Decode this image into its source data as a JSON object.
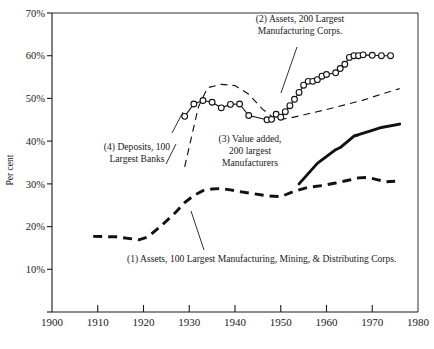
{
  "chart_data": {
    "type": "line",
    "title": "",
    "xlabel": "",
    "ylabel": "Per cent",
    "xlim": [
      1900,
      1980
    ],
    "ylim": [
      0,
      70
    ],
    "grid": false,
    "legend_position": "inline-annotations",
    "x_ticks": [
      1900,
      1910,
      1920,
      1930,
      1940,
      1950,
      1960,
      1970,
      1980
    ],
    "x_tick_labels": [
      "1900",
      "1910",
      "1920",
      "1930",
      "1940",
      "1950",
      "1960",
      "1970",
      "1980"
    ],
    "y_ticks": [
      10,
      20,
      30,
      40,
      50,
      60,
      70
    ],
    "y_tick_labels": [
      "10%",
      "20%",
      "30%",
      "40%",
      "50%",
      "60%",
      "70%"
    ],
    "series": [
      {
        "id": "series-1",
        "name": "(1) Assets, 100 Largest Manufacturing, Mining, & Distributing Corps.",
        "style": "heavy-dashed",
        "markers": false,
        "x": [
          1909,
          1914,
          1919,
          1921,
          1924,
          1927,
          1929,
          1931,
          1933,
          1935,
          1937,
          1939,
          1941,
          1944,
          1947,
          1950,
          1953,
          1956,
          1959,
          1962,
          1965,
          1967,
          1969,
          1971,
          1973,
          1975
        ],
        "y": [
          17.7,
          17.6,
          16.9,
          17.6,
          20.3,
          23.3,
          25.6,
          27.3,
          28.4,
          28.8,
          28.9,
          28.6,
          28.2,
          27.7,
          27.2,
          27.0,
          28.3,
          29.2,
          29.6,
          30.2,
          30.9,
          31.4,
          31.5,
          31.0,
          30.5,
          30.6
        ]
      },
      {
        "id": "series-2",
        "name": "(2) Assets, 200 Largest Manufacturing Corps.",
        "style": "thin-solid-with-circles",
        "markers": true,
        "x": [
          1929,
          1931,
          1933,
          1935,
          1937,
          1939,
          1941,
          1943,
          1947,
          1948,
          1949,
          1950,
          1951,
          1952,
          1953,
          1954,
          1955,
          1956,
          1957,
          1958,
          1959,
          1960,
          1962,
          1963,
          1964,
          1965,
          1966,
          1967,
          1968,
          1970,
          1972,
          1974
        ],
        "y": [
          45.8,
          48.7,
          49.5,
          49.1,
          47.8,
          48.6,
          48.7,
          46.0,
          45.0,
          45.1,
          46.3,
          45.6,
          46.9,
          48.3,
          49.8,
          51.4,
          53.1,
          54.0,
          54.0,
          54.4,
          55.2,
          55.6,
          56.0,
          57.0,
          58.0,
          59.6,
          60.0,
          60.0,
          60.2,
          60.1,
          60.0,
          60.0
        ]
      },
      {
        "id": "series-3",
        "name": "(3) Value added, 200 largest Manufacturers",
        "style": "heavy-solid",
        "markers": false,
        "x": [
          1954,
          1958,
          1962,
          1963,
          1966,
          1967,
          1970,
          1972,
          1976
        ],
        "y": [
          30.0,
          34.8,
          38.0,
          38.5,
          41.2,
          41.5,
          42.5,
          43.2,
          44.0
        ]
      },
      {
        "id": "series-4",
        "name": "(4) Deposits, 100 Largest Banks",
        "style": "thin-dashed",
        "markers": false,
        "x": [
          1929,
          1932,
          1934,
          1937,
          1940,
          1943,
          1946,
          1949,
          1952,
          1956,
          1960,
          1964,
          1968,
          1972,
          1976
        ],
        "y": [
          34.0,
          48.0,
          52.5,
          53.3,
          53.0,
          51.0,
          47.5,
          45.0,
          45.4,
          46.4,
          47.4,
          48.5,
          49.6,
          51.0,
          52.3
        ]
      }
    ],
    "annotations": [
      {
        "id": "annot-1",
        "lines": [
          "(1) Assets, 100 Largest Manufacturing, Mining, & Distributing Corps."
        ],
        "anchor": "start"
      },
      {
        "id": "annot-2",
        "lines": [
          "(2) Assets, 200 Largest",
          "Manufacturing Corps."
        ],
        "anchor": "middle"
      },
      {
        "id": "annot-3",
        "lines": [
          "(3) Value added,",
          "200 largest",
          "Manufacturers"
        ],
        "anchor": "middle"
      },
      {
        "id": "annot-4",
        "lines": [
          "(4) Deposits, 100",
          "Largest Banks"
        ],
        "anchor": "middle"
      }
    ],
    "colors": {
      "ink": "#111111",
      "background": "#ffffff"
    }
  }
}
